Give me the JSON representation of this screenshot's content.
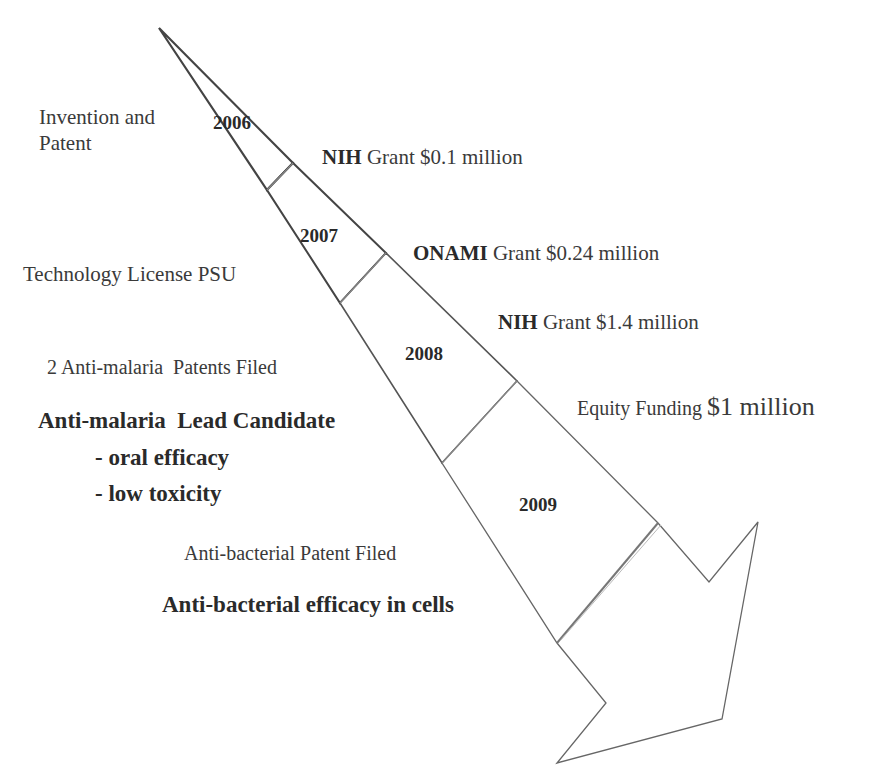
{
  "diagram": {
    "type": "timeline-arrow",
    "colors": {
      "outline": "#444444",
      "divider": "#777777",
      "text": "#3a3a3a",
      "background": "#ffffff"
    },
    "years": [
      {
        "label": "2006"
      },
      {
        "label": "2007"
      },
      {
        "label": "2008"
      },
      {
        "label": "2009"
      }
    ],
    "left_milestones": {
      "invention_line1": "Invention and",
      "invention_line2": "Patent",
      "license_prefix": "Technology License ",
      "license_bold": "PSU",
      "malaria_patents": "2 Anti-malaria  Patents Filed",
      "malaria_lead": "Anti-malaria  Lead Candidate",
      "malaria_point1": "- oral efficacy",
      "malaria_point2": "- low toxicity",
      "bacterial_patent": "Anti-bacterial Patent Filed",
      "bacterial_efficacy": "Anti-bacterial efficacy in cells"
    },
    "right_funding": {
      "grant1_org": "NIH",
      "grant1_text": " Grant $0.1 million",
      "grant2_org": "ONAMI",
      "grant2_text": " Grant $0.24 million",
      "grant3_org": "NIH",
      "grant3_text": " Grant $1.4 million",
      "equity_prefix": "Equity Funding ",
      "equity_amount": "$1 million"
    }
  }
}
